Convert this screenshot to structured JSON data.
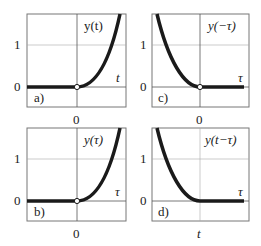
{
  "figure": {
    "panels": [
      {
        "id": "a",
        "label": "a)",
        "func_label": "y(t)",
        "x_axis_label": "t",
        "x_tick": "0",
        "y_ticks": [
          "0",
          "1"
        ],
        "curve": "ramp-right",
        "origin_marker": "open-circle"
      },
      {
        "id": "c",
        "label": "c)",
        "func_label": "y(−τ)",
        "x_axis_label": "τ",
        "x_tick": "0",
        "y_ticks": [
          "0",
          "1"
        ],
        "curve": "ramp-left",
        "origin_marker": "open-circle"
      },
      {
        "id": "b",
        "label": "b)",
        "func_label": "y(τ)",
        "x_axis_label": "τ",
        "x_tick": "0",
        "y_ticks": [
          "0",
          "1"
        ],
        "curve": "ramp-right",
        "origin_marker": "open-circle"
      },
      {
        "id": "d",
        "label": "d)",
        "func_label": "y(t−τ)",
        "x_axis_label": "τ",
        "x_tick": "t",
        "y_ticks": [
          "0",
          "1"
        ],
        "curve": "ramp-left",
        "origin_marker": "none"
      }
    ]
  },
  "colors": {
    "curve": "#1a1a1a",
    "axis": "#555555",
    "grid": "#aaaaaa",
    "frame": "#777777"
  }
}
